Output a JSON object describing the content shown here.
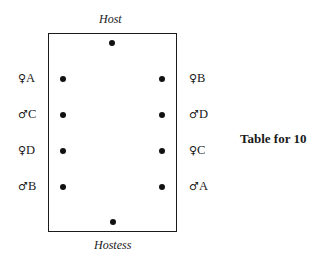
{
  "roles": {
    "top": "Host",
    "bottom": "Hostess"
  },
  "caption": "Table for 10",
  "guests_left": [
    {
      "symbol": "♀",
      "name": "A"
    },
    {
      "symbol": "♂",
      "name": "C"
    },
    {
      "symbol": "♀",
      "name": "D"
    },
    {
      "symbol": "♂",
      "name": "B"
    }
  ],
  "guests_right": [
    {
      "symbol": "♀",
      "name": "B"
    },
    {
      "symbol": "♂",
      "name": "D"
    },
    {
      "symbol": "♀",
      "name": "C"
    },
    {
      "symbol": "♂",
      "name": "A"
    }
  ],
  "seat_count": 10
}
